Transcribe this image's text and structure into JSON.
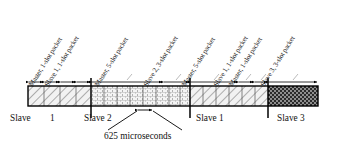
{
  "figure": {
    "caption": "625 microseconds",
    "axis_color": "#000000",
    "bar": {
      "x": 28,
      "y": 86,
      "width": 290,
      "height": 20,
      "border_color": "#000000"
    }
  },
  "packets": [
    {
      "id": "p1",
      "label": "Master, 1-slot packet",
      "start": 28,
      "end": 44,
      "slots": 1,
      "owner": "master",
      "fill": "diag-light"
    },
    {
      "id": "p2",
      "label": "Slave 1, 1-slot packet",
      "start": 44,
      "end": 60,
      "slots": 1,
      "owner": "slave1",
      "fill": "diag-light"
    },
    {
      "id": "p3",
      "label": "Master, 5-slot packet",
      "start": 91,
      "end": 163,
      "slots": 5,
      "owner": "master",
      "fill": "brick"
    },
    {
      "id": "p4",
      "label": "Slave 2, 3-slot packet",
      "start": 163,
      "end": 190,
      "slots": 3,
      "owner": "slave2",
      "fill": "brick"
    },
    {
      "id": "p5",
      "label": "Master, 5-slot packet",
      "start": 190,
      "end": 238,
      "slots": 5,
      "owner": "master",
      "fill": "diag-light"
    },
    {
      "id": "p6",
      "label": "Slave 1, 1-slot packet",
      "start": 238,
      "end": 254,
      "slots": 1,
      "owner": "slave1",
      "fill": "diag-light"
    },
    {
      "id": "p7",
      "label": "Master, 1-slot packet",
      "start": 254,
      "end": 268,
      "slots": 1,
      "owner": "master",
      "fill": "diag-light"
    },
    {
      "id": "p8",
      "label": "Slave 3, 3-slot packet",
      "start": 268,
      "end": 318,
      "slots": 3,
      "owner": "slave3",
      "fill": "checker"
    }
  ],
  "regions": [
    {
      "id": "r1",
      "label": "Slave",
      "label2": "1",
      "start": 28,
      "end": 91,
      "fill": "diag-light",
      "slot_count": 4
    },
    {
      "id": "r2",
      "label": "Slave 2",
      "label2": "",
      "start": 91,
      "end": 190,
      "fill": "brick",
      "slot_count": 8
    },
    {
      "id": "r3",
      "label": "Slave 1",
      "label2": "",
      "start": 190,
      "end": 268,
      "fill": "diag-light",
      "slot_count": 6
    },
    {
      "id": "r4",
      "label": "Slave 3",
      "label2": "",
      "start": 268,
      "end": 318,
      "fill": "checker",
      "slot_count": 4
    }
  ],
  "bottom_labels": [
    {
      "text": "Slave",
      "x": 10,
      "y": 113
    },
    {
      "text": "1",
      "x": 50,
      "y": 113
    },
    {
      "text": "Slave 2",
      "x": 84,
      "y": 113
    },
    {
      "text": "Slave 1",
      "x": 196,
      "y": 113
    },
    {
      "text": "Slave 3",
      "x": 277,
      "y": 113
    }
  ],
  "caption": {
    "text": "625 microseconds",
    "x": 104,
    "y": 138
  },
  "slot_marker": {
    "start": 137,
    "end": 153,
    "y": 110,
    "label": "625 microseconds"
  },
  "region_dividers": [
    91,
    190,
    268
  ],
  "arrow_row_y": 82
}
